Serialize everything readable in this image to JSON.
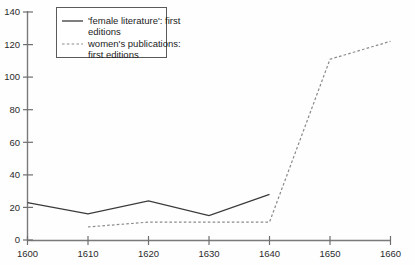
{
  "chart_data": {
    "type": "line",
    "title": "",
    "subtitle": "",
    "xlabel": "",
    "ylabel": "",
    "x": [
      1600,
      1610,
      1620,
      1630,
      1640,
      1650,
      1660
    ],
    "categories": [
      "1600",
      "1610",
      "1620",
      "1630",
      "1640",
      "1650",
      "1660"
    ],
    "xlim": [
      1600,
      1660
    ],
    "ylim": [
      0,
      140
    ],
    "x_ticks": [
      1600,
      1610,
      1620,
      1630,
      1640,
      1650,
      1660
    ],
    "y_ticks": [
      0,
      20,
      40,
      60,
      80,
      100,
      120,
      140
    ],
    "x_tick_labels": [
      "1600",
      "1610",
      "1620",
      "1630",
      "1640",
      "1650",
      "1660"
    ],
    "y_tick_labels": [
      "0",
      "20",
      "40",
      "60",
      "80",
      "100",
      "120",
      "140"
    ],
    "grid": false,
    "legend_position": "top-left",
    "series": [
      {
        "name": "'female literature': first editions",
        "style": "solid",
        "color": "#3a3a3a",
        "x": [
          1600,
          1610,
          1620,
          1630,
          1640
        ],
        "values": [
          23,
          16,
          24,
          15,
          28
        ]
      },
      {
        "name": "women's publications: first editions",
        "style": "dashed",
        "color": "#8b8b8b",
        "x": [
          1610,
          1620,
          1630,
          1640,
          1650,
          1660
        ],
        "values": [
          8,
          11,
          11,
          11,
          111,
          122
        ]
      }
    ]
  },
  "legend": {
    "entries": [
      {
        "label": "'female literature': first editions",
        "line1": "'female literature': first",
        "line2": "editions"
      },
      {
        "label": "women's publications: first editions",
        "line1": "women's publications:",
        "line2": "first editions"
      }
    ]
  },
  "axes": {
    "y_labels": [
      "140",
      "120",
      "100",
      "80",
      "60",
      "40",
      "20",
      "0"
    ],
    "x_labels": [
      "1600",
      "1610",
      "1620",
      "1630",
      "1640",
      "1650",
      "1660"
    ]
  },
  "colors": {
    "background": "#fefefe",
    "axis": "#7a7a7a",
    "solid_series": "#3a3a3a",
    "dashed_series": "#8b8b8b",
    "text": "#2b2b2b"
  }
}
